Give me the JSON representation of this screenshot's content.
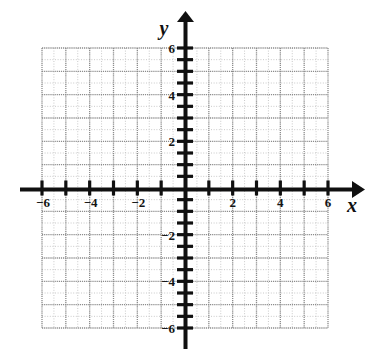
{
  "figure": {
    "kind": "cartesian-coordinate-plane",
    "background_color": "#ffffff",
    "axis_color": "#101010",
    "major_grid_color": "#8c8c8c",
    "minor_grid_color": "#c9c9c9"
  },
  "labels": {
    "x_axis_label": "x",
    "y_axis_label": "y"
  },
  "chart_data": {
    "type": "scatter",
    "title": "",
    "subtitle": "",
    "xlabel": "x",
    "ylabel": "y",
    "xlim": [
      -6,
      6
    ],
    "ylim": [
      -6,
      6
    ],
    "grid": true,
    "legend_position": "none",
    "series": [
      {
        "name": "",
        "x": [],
        "y": []
      }
    ],
    "annotations": [],
    "x_ticks": [
      -6,
      -5,
      -4,
      -3,
      -2,
      -1,
      0,
      1,
      2,
      3,
      4,
      5,
      6
    ],
    "y_ticks": [
      -6,
      -5,
      -4,
      -3,
      -2,
      -1,
      0,
      1,
      2,
      3,
      4,
      5,
      6
    ],
    "x_minor_step": 0.5,
    "y_minor_step": 0.5,
    "x_tick_labels": [
      "−6",
      "−4",
      "−2",
      "2",
      "4",
      "6"
    ],
    "x_tick_label_values": [
      -6,
      -4,
      -2,
      2,
      4,
      6
    ],
    "y_tick_labels": [
      "6",
      "4",
      "2",
      "−2",
      "−4",
      "−6"
    ],
    "y_tick_label_values": [
      6,
      4,
      2,
      -2,
      -4,
      -6
    ]
  }
}
